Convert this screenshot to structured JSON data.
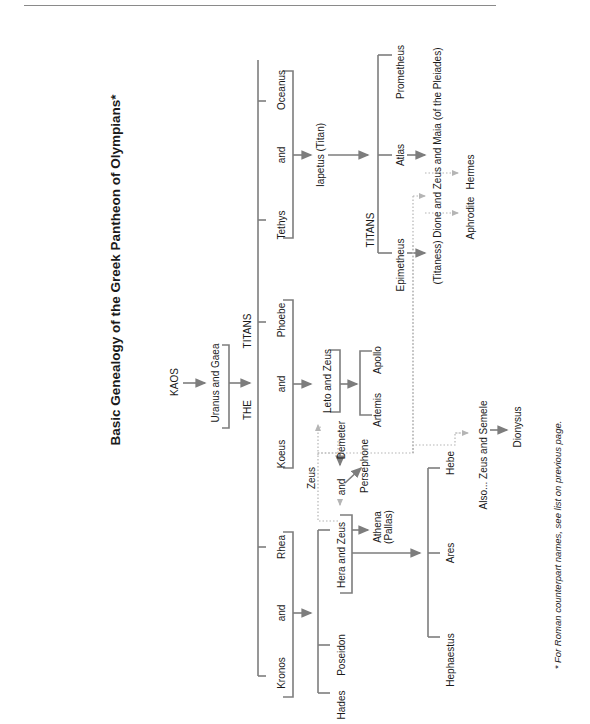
{
  "title": "Basic Genealogy of the Greek Pantheon of Olympians*",
  "footnote": "* For Roman counterpart names, see list on previous page.",
  "colors": {
    "line": "#7d7d7d",
    "dotted": "#b5b5b5",
    "text": "#1a1a1a"
  },
  "nodes": {
    "kaos": "KAOS",
    "uranus_gaea": "Uranus and Gaea",
    "the": "THE",
    "titans_top": "TITANS",
    "kronos": "Kronos",
    "and_kronos_rhea": "and",
    "rhea": "Rhea",
    "koeus": "Koeus",
    "and_koeus_phoebe": "and",
    "phoebe": "Phoebe",
    "tethys": "Tethys",
    "and_tethys_oceanus": "and",
    "oceanus": "Oceanus",
    "iapetus": "Iapetus (Titan)",
    "titans_iapetus": "TITANS",
    "epimetheus": "Epimetheus",
    "atlas": "Atlas",
    "prometheus": "Prometheus",
    "dione_maia": "(Titaness) Dione and Zeus and Maia (of the Pleiades)",
    "aphrodite": "Aphrodite",
    "hermes": "Hermes",
    "leto_zeus": "Leto and Zeus",
    "artemis": "Artemis",
    "apollo": "Apollo",
    "zeus_demeter_zeus": "Zeus",
    "and_zeus_demeter": "and",
    "demeter": "Demeter",
    "persephone": "Persephone",
    "hades": "Hades",
    "poseidon": "Poseidon",
    "hera_zeus": "Hera  and  Zeus",
    "athena": "Athena\n(Pallas)",
    "hephaestus": "Hephaestus",
    "ares": "Ares",
    "hebe": "Hebe",
    "also_zeus_semele": "Also... Zeus and Semele",
    "dionysus": "Dionysus"
  }
}
